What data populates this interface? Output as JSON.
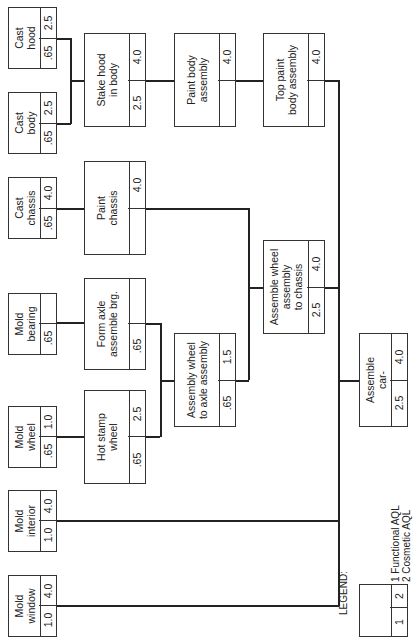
{
  "diagram": {
    "nodes": [
      {
        "id": "cast-hood",
        "label": "Cast\nhood",
        "functional": ".65",
        "cosmetic": "2.5"
      },
      {
        "id": "cast-body",
        "label": "Cast\nbody",
        "functional": ".65",
        "cosmetic": "2.5"
      },
      {
        "id": "stake-hood",
        "label": "Stake hood\nin body",
        "functional": "2.5",
        "cosmetic": "4.0"
      },
      {
        "id": "paint-body",
        "label": "Paint body\nassembly",
        "functional": "",
        "cosmetic": "4.0"
      },
      {
        "id": "top-paint",
        "label": "Top paint\nbody assembly",
        "functional": "",
        "cosmetic": "4.0"
      },
      {
        "id": "cast-chassis",
        "label": "Cast\nchassis",
        "functional": ".65",
        "cosmetic": "4.0"
      },
      {
        "id": "paint-chassis",
        "label": "Paint\nchassis",
        "functional": "",
        "cosmetic": "4.0"
      },
      {
        "id": "assemble-wheel-chassis",
        "label": "Assemble wheel\nassembly\nto chassis",
        "functional": "2.5",
        "cosmetic": "4.0"
      },
      {
        "id": "mold-bearing",
        "label": "Mold\nbearing",
        "functional": ".65",
        "cosmetic": ""
      },
      {
        "id": "form-axle",
        "label": "Form axle\nassemble brg.",
        "functional": ".65",
        "cosmetic": ""
      },
      {
        "id": "mold-wheel",
        "label": "Mold\nwheel",
        "functional": ".65",
        "cosmetic": "1.0"
      },
      {
        "id": "hot-stamp",
        "label": "Hot stamp\nwheel",
        "functional": ".65",
        "cosmetic": "2.5"
      },
      {
        "id": "assembly-wheel-axle",
        "label": "Assembly wheel\nto axle assembly",
        "functional": ".65",
        "cosmetic": "1.5"
      },
      {
        "id": "assemble-car",
        "label": "Assemble\ncar-",
        "functional": "2.5",
        "cosmetic": "4.0"
      },
      {
        "id": "mold-interior",
        "label": "Mold\ninterior",
        "functional": "1.0",
        "cosmetic": "4.0"
      },
      {
        "id": "mold-window",
        "label": "Mold\nwindow",
        "functional": "1.0",
        "cosmetic": "4.0"
      }
    ],
    "edges": [
      [
        "cast-hood",
        "stake-hood"
      ],
      [
        "cast-body",
        "stake-hood"
      ],
      [
        "stake-hood",
        "paint-body"
      ],
      [
        "paint-body",
        "top-paint"
      ],
      [
        "top-paint",
        "assemble-car"
      ],
      [
        "cast-chassis",
        "paint-chassis"
      ],
      [
        "paint-chassis",
        "assemble-wheel-chassis"
      ],
      [
        "mold-bearing",
        "form-axle"
      ],
      [
        "form-axle",
        "assembly-wheel-axle"
      ],
      [
        "mold-wheel",
        "hot-stamp"
      ],
      [
        "hot-stamp",
        "assembly-wheel-axle"
      ],
      [
        "assembly-wheel-axle",
        "assemble-wheel-chassis"
      ],
      [
        "assemble-wheel-chassis",
        "assemble-car"
      ],
      [
        "mold-interior",
        "assemble-car"
      ],
      [
        "mold-window",
        "assemble-car"
      ]
    ]
  },
  "legend": {
    "title": "LEGEND:",
    "cell1": "1",
    "cell2": "2",
    "item1": "1 Functional AQL",
    "item2": "2 Cosmetic AQL"
  }
}
